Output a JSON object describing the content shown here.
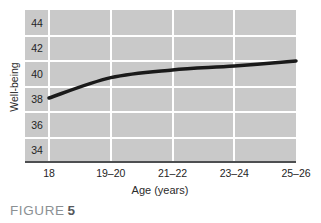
{
  "figure": {
    "caption_label": "FIGURE",
    "caption_number": "5"
  },
  "chart_data": {
    "type": "line",
    "title": "",
    "xlabel": "Age (years)",
    "ylabel": "Well-being",
    "categories": [
      "18",
      "19–20",
      "21–22",
      "23–24",
      "25–26"
    ],
    "series": [
      {
        "name": "Well-being",
        "values": [
          38.1,
          39.7,
          40.3,
          40.6,
          41.0
        ]
      }
    ],
    "y_ticks": [
      44,
      42,
      40,
      38,
      36,
      34
    ],
    "ylim": [
      33,
      45
    ],
    "grid": true,
    "legend": false,
    "colors": {
      "line": "#1a1a1a",
      "plot_bg": "#c9c9c9",
      "gridline": "#ffffff",
      "axis_line": "#4d4f51",
      "tick_text": "#242424",
      "caption_label": "#8b9093",
      "caption_number": "#55585c"
    }
  }
}
